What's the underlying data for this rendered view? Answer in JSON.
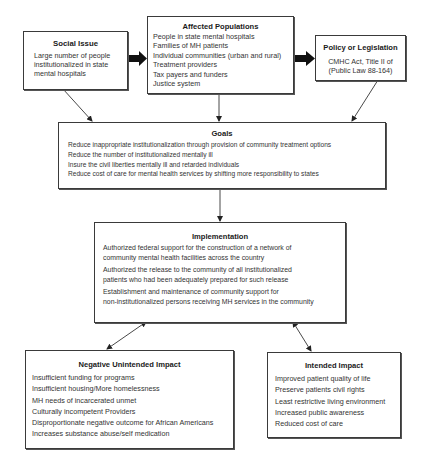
{
  "diagram": {
    "social_issue": {
      "title": "Social Issue",
      "lines": [
        "Large number of people",
        "institutionalized in state",
        "mental hospitals"
      ]
    },
    "affected_populations": {
      "title": "Affected Populations",
      "items": [
        "People in state mental hospitals",
        "Families of MH patients",
        "Individual communities (urban and rural)",
        "Treatment providers",
        "Tax payers and funders",
        "Justice system"
      ]
    },
    "policy": {
      "title": "Policy or Legislation",
      "lines": [
        "CMHC Act, Title II of",
        "(Public Law 88-164)"
      ]
    },
    "goals": {
      "title": "Goals",
      "items": [
        "Reduce inappropriate institutionalization through provision of community treatment options",
        "Reduce the number of institutionalized mentally ill",
        "Insure the civil liberties mentally ill and retarded individuals",
        "Reduce cost of care for mental health services by shifting more responsibility to states"
      ]
    },
    "implementation": {
      "title": "Implementation",
      "items": [
        [
          "Authorized federal support for the construction of a network of",
          "community mental health facilities across the country"
        ],
        [
          "Authorized the release to the community of  all institutionalized",
          "patients who had been adequately prepared for such release"
        ],
        [
          "Establishment and maintenance of community support for",
          "non-institutionalized persons receiving MH services in the community"
        ]
      ]
    },
    "negative_impact": {
      "title": "Negative Unintended Impact",
      "items": [
        "Insufficient funding for programs",
        "Insufficient housing/More homelessness",
        "MH needs of incarcerated unmet",
        "Culturally incompetent Providers",
        "Disproportionate negative outcome for African Americans",
        "Increases substance abuse/self medication"
      ]
    },
    "intended_impact": {
      "title": "Intended Impact",
      "items": [
        "Improved patient quality of life",
        "Preserve patients civil rights",
        "Least restrictive living environment",
        "Increased public awareness",
        "Reduced cost of care"
      ]
    }
  }
}
